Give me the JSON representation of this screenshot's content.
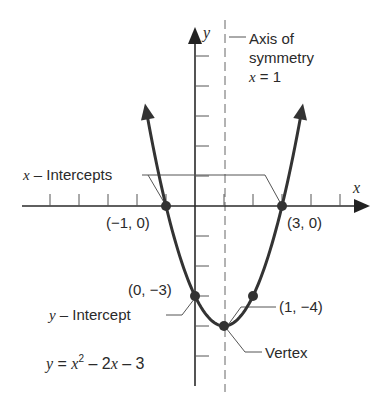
{
  "chart_data": {
    "type": "line",
    "title": "",
    "equation": "y = x² − 2x − 3",
    "function": {
      "a": 1,
      "b": -2,
      "c": -3
    },
    "x_range": [
      -1.65,
      3.65
    ],
    "xlabel": "x",
    "ylabel": "y",
    "xlim": [
      -6,
      6
    ],
    "ylim": [
      -6,
      6
    ],
    "x_ticks": [
      -5,
      -4,
      -3,
      -2,
      -1,
      1,
      2,
      3,
      4,
      5
    ],
    "y_ticks": [
      5,
      4,
      3,
      2,
      1,
      -1,
      -2,
      -3,
      -4,
      -5
    ],
    "grid": false,
    "axis_of_symmetry": 1,
    "points": [
      {
        "x": -1,
        "y": 0,
        "label": "(−1, 0)"
      },
      {
        "x": 3,
        "y": 0,
        "label": "(3, 0)"
      },
      {
        "x": 0,
        "y": -3,
        "label": "(0, −3)"
      },
      {
        "x": 1,
        "y": -4,
        "label": "(1, −4)"
      },
      {
        "x": 2,
        "y": -3,
        "label": ""
      }
    ],
    "annotations": {
      "x_intercepts": "x – Intercepts",
      "y_intercept": "y – Intercept",
      "vertex": "Vertex",
      "axis_of_symmetry_line1": "Axis of",
      "axis_of_symmetry_line2": "symmetry",
      "axis_of_symmetry_line3": "x = 1"
    }
  },
  "labels": {
    "x_axis": "x",
    "y_axis": "y",
    "axis_sym_1": "Axis of",
    "axis_sym_2": "symmetry",
    "axis_sym_3_var": "x",
    "axis_sym_3_rest": " = 1",
    "x_intercepts_var": "x",
    "x_intercepts_rest": " – Intercepts",
    "pt_neg1_0": "(−1, 0)",
    "pt_3_0": "(3, 0)",
    "pt_0_neg3": "(0, −3)",
    "pt_1_neg4": "(1, −4)",
    "y_intercept_var": "y",
    "y_intercept_rest": " – Intercept",
    "vertex": "Vertex",
    "eq_y": "y",
    "eq_eq": " = ",
    "eq_x": "x",
    "eq_sup": "2",
    "eq_rest1": " – 2",
    "eq_x2": "x",
    "eq_rest2": " – 3"
  }
}
